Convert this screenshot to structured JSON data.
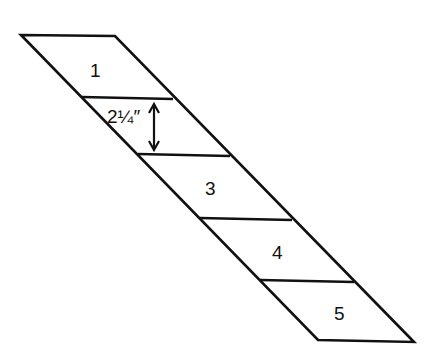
{
  "diagram": {
    "type": "slanted-strip-segments",
    "stroke_color": "#111111",
    "segments": [
      {
        "label": "1"
      },
      {
        "label": "2¼″"
      },
      {
        "label": "3"
      },
      {
        "label": "4"
      },
      {
        "label": "5"
      }
    ],
    "dimension": {
      "label": "2¼″",
      "meaning": "segment height"
    }
  }
}
